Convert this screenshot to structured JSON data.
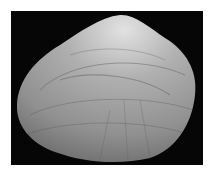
{
  "image": {
    "subject": "clam shell (bivalve) on black background",
    "colors": {
      "background_page": "#ffffff",
      "background_frame": "#060606",
      "shell_light": "#d8d8d8",
      "shell_mid": "#9a9a9a",
      "shell_dark": "#6a6a6a"
    }
  }
}
